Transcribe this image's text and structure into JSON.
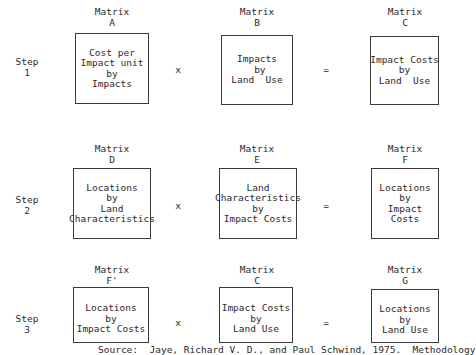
{
  "steps": [
    {
      "label": "Step\n1",
      "operator": "x",
      "equals": "=",
      "matrices": [
        {
          "label": "Matrix\nA",
          "text": "Cost per\nImpact unit\nby\nImpacts"
        },
        {
          "label": "Matrix\nB",
          "text": "Impacts\n by\nLand  Use"
        },
        {
          "label": "Matrix\nC",
          "text": "Impact Costs\nby\nLand  Use"
        }
      ]
    },
    {
      "label": "Step\n2",
      "operator": "x",
      "equals": "=",
      "matrices": [
        {
          "label": "Matrix\nD",
          "text": "Locations\nby\nLand\nCharacteristics"
        },
        {
          "label": "Matrix\nE",
          "text": "Land\nCharacteristics\nby\nImpact Costs"
        },
        {
          "label": "Matrix\nF",
          "text": "Locations\nby\nImpact\nCosts"
        }
      ]
    },
    {
      "label": "Step\n3",
      "operator": "x",
      "equals": "=",
      "matrices": [
        {
          "label": "Matrix\nF'",
          "text": "Locations\nby\nImpact Costs"
        },
        {
          "label": "Matrix\nC",
          "text": "Impact Costs\nby\nLand Use"
        },
        {
          "label": "Matrix\nG",
          "text": "Locations\nby\nLand Use"
        }
      ]
    }
  ],
  "source": "Source:  Jaye, Richard V. D., and Paul Schwind, 1975.  Methodology"
}
